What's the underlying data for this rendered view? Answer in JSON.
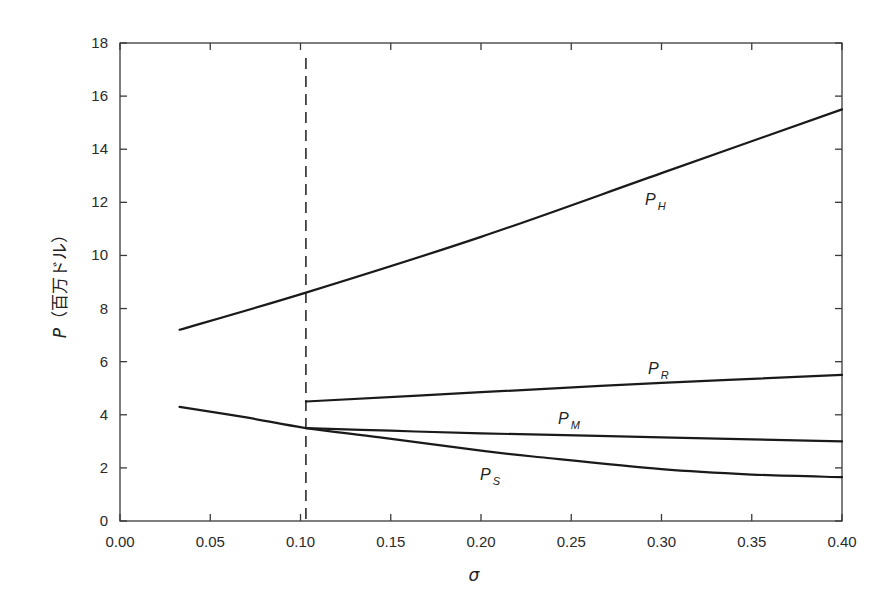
{
  "chart_data": {
    "type": "line",
    "title": "",
    "xlabel": "σ",
    "ylabel": "P（百万ドル）",
    "ylabel_var": "P",
    "ylabel_unit": "（百万ドル）",
    "xlim": [
      0.0,
      0.4
    ],
    "ylim": [
      0,
      18
    ],
    "x_ticks": [
      "0.00",
      "0.05",
      "0.10",
      "0.15",
      "0.20",
      "0.25",
      "0.30",
      "0.35",
      "0.40"
    ],
    "y_ticks": [
      "0",
      "2",
      "4",
      "6",
      "8",
      "10",
      "12",
      "14",
      "16",
      "18"
    ],
    "grid": false,
    "legend": "inline labels",
    "vertical_reference_line": {
      "x": 0.103,
      "style": "dashed"
    },
    "series": [
      {
        "name": "P_H",
        "label_main": "P",
        "label_sub": "H",
        "x": [
          0.033,
          0.103,
          0.2,
          0.3,
          0.4
        ],
        "y": [
          7.2,
          8.6,
          10.7,
          13.1,
          15.5
        ]
      },
      {
        "name": "P_R",
        "label_main": "P",
        "label_sub": "R",
        "x": [
          0.103,
          0.2,
          0.3,
          0.4
        ],
        "y": [
          4.5,
          4.85,
          5.2,
          5.5
        ]
      },
      {
        "name": "P_M",
        "label_main": "P",
        "label_sub": "M",
        "x": [
          0.103,
          0.15,
          0.2,
          0.3,
          0.4
        ],
        "y": [
          3.5,
          3.4,
          3.3,
          3.15,
          3.0
        ]
      },
      {
        "name": "P_S",
        "label_main": "P",
        "label_sub": "S",
        "x": [
          0.033,
          0.07,
          0.103,
          0.144,
          0.2,
          0.233,
          0.3,
          0.35,
          0.4
        ],
        "y": [
          4.3,
          3.9,
          3.5,
          3.15,
          2.65,
          2.4,
          1.95,
          1.75,
          1.65
        ]
      }
    ]
  }
}
